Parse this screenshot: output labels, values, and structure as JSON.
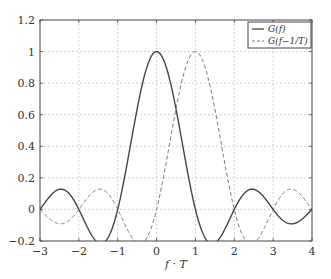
{
  "chart_data": {
    "type": "line",
    "title": "",
    "xlabel": "f · T",
    "ylabel": "",
    "xlim": [
      -3,
      4
    ],
    "ylim": [
      -0.2,
      1.2
    ],
    "grid": true,
    "legend_position": "upper right",
    "x_ticks": [
      "−3",
      "−2",
      "−1",
      "0",
      "1",
      "2",
      "3",
      "4"
    ],
    "y_ticks": [
      "−0.2",
      "0",
      "0.2",
      "0.4",
      "0.6",
      "0.8",
      "1",
      "1.2"
    ],
    "series": [
      {
        "name": "G(f)",
        "style": "solid",
        "color": "#444444",
        "function": "sinc(fT)",
        "x": [
          -3,
          -2.5,
          -2,
          -1.43,
          -1,
          -0.5,
          0,
          0.5,
          1,
          1.43,
          2,
          2.5,
          3,
          3.47,
          4
        ],
        "values": [
          0,
          0.127,
          0,
          -0.217,
          0,
          0.637,
          1,
          0.637,
          0,
          -0.217,
          0,
          0.127,
          0,
          -0.091,
          0
        ]
      },
      {
        "name": "G(f−1/T)",
        "style": "dashed",
        "color": "#777777",
        "function": "sinc(fT−1)",
        "x": [
          -3,
          -2.47,
          -2,
          -1.5,
          -1,
          -0.43,
          0,
          0.5,
          1,
          1.5,
          2,
          2.43,
          3,
          3.5,
          4
        ],
        "values": [
          0,
          -0.091,
          0,
          0.127,
          0,
          -0.217,
          0,
          0.637,
          1,
          0.637,
          0,
          -0.217,
          0,
          0.127,
          0
        ]
      }
    ]
  },
  "legend": {
    "items": [
      {
        "label": "G(f)"
      },
      {
        "label": "G(f−1/T)"
      }
    ]
  },
  "axis": {
    "xlabel": "f · T"
  }
}
